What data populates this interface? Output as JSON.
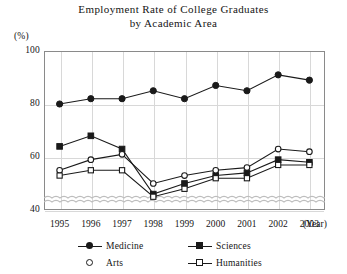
{
  "chart_data": {
    "type": "line",
    "title": "Employment Rate of College Graduates by Academic Area",
    "title_line1": "Employment Rate of College Graduates",
    "title_line2": "by Academic Area",
    "ylabel": "(%)",
    "xlabel": "(Year)",
    "categories": [
      "1995",
      "1996",
      "1997",
      "1998",
      "1999",
      "2000",
      "2001",
      "2002",
      "2003"
    ],
    "x": [
      1995,
      1996,
      1997,
      1998,
      1999,
      2000,
      2001,
      2002,
      2003
    ],
    "ylim": [
      40,
      100
    ],
    "yticks": [
      100,
      80,
      60,
      40
    ],
    "ytick_labels": [
      "100",
      "80",
      "60",
      "40"
    ],
    "axis_break": true,
    "grid": true,
    "legend_position": "bottom",
    "series": [
      {
        "name": "Medicine",
        "marker": "circle-filled",
        "values": [
          80,
          82,
          82,
          85,
          82,
          87,
          85,
          91,
          89
        ]
      },
      {
        "name": "Sciences",
        "marker": "square-filled",
        "values": [
          64,
          68,
          63,
          46,
          50,
          53,
          54,
          59,
          58
        ]
      },
      {
        "name": "Arts",
        "marker": "circle-open",
        "values": [
          55,
          59,
          61,
          50,
          53,
          55,
          56,
          63,
          62
        ]
      },
      {
        "name": "Humanities",
        "marker": "square-open",
        "values": [
          53,
          55,
          55,
          45,
          48,
          52,
          52,
          57,
          57
        ]
      }
    ]
  },
  "legend": {
    "items": [
      {
        "label": "Medicine",
        "marker": "circle-filled"
      },
      {
        "label": "Sciences",
        "marker": "square-filled"
      },
      {
        "label": "Arts",
        "marker": "circle-open"
      },
      {
        "label": "Humanities",
        "marker": "square-open"
      }
    ]
  },
  "colors": {
    "ink": "#1a1a1a",
    "frame": "#8a8a8a",
    "grid": "#d8d8d8",
    "background": "#ffffff"
  }
}
